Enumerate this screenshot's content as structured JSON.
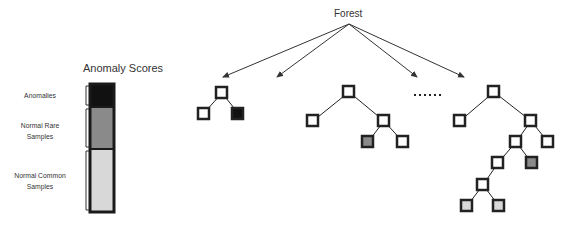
{
  "legend": {
    "title": "Anomaly Scores",
    "items": [
      {
        "label": "Anomalies",
        "color": "#111111"
      },
      {
        "label": "Normal Rare Samples",
        "line1": "Normal Rare",
        "line2": "Samples",
        "color": "#8a8a8a"
      },
      {
        "label": "Normal Common Samples",
        "line1": "Normal Common",
        "line2": "Samples",
        "color": "#d8d8d8"
      }
    ]
  },
  "forest": {
    "label": "Forest",
    "ellipsis": "......",
    "trees": [
      {
        "name": "tree-1",
        "nodes": 3,
        "highlighted": [
          "anomaly leaf"
        ]
      },
      {
        "name": "tree-2",
        "nodes": 5,
        "highlighted": [
          "rare leaf"
        ]
      },
      {
        "name": "tree-3",
        "nodes": 10,
        "highlighted": [
          "rare leaf",
          "common leaf",
          "common leaf"
        ]
      }
    ]
  }
}
